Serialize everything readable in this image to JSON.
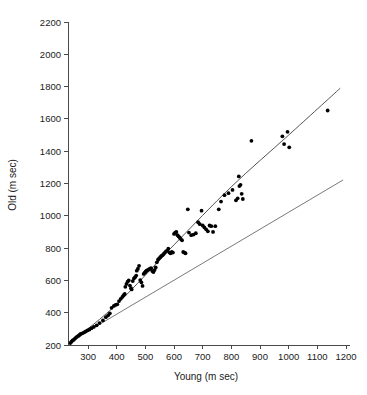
{
  "chart_data": {
    "type": "scatter",
    "title": "",
    "xlabel": "Young (m sec)",
    "ylabel": "Old (m sec)",
    "xlim": [
      230,
      1200
    ],
    "ylim": [
      200,
      2200
    ],
    "grid": false,
    "legend": "none",
    "xticks": [
      300,
      400,
      500,
      600,
      700,
      800,
      900,
      1000,
      1100,
      1200
    ],
    "yticks": [
      200,
      400,
      600,
      800,
      1000,
      1200,
      1400,
      1600,
      1800,
      2000,
      2200
    ],
    "xtick_labels": [
      "300",
      "400",
      "500",
      "600",
      "700",
      "800",
      "900",
      "1000",
      "1100",
      "1200"
    ],
    "ytick_labels": [
      "200",
      "400",
      "600",
      "800",
      "1000",
      "1200",
      "1400",
      "1600",
      "1800",
      "2000",
      "2200"
    ],
    "point_color": "#000000",
    "fit_line_color": "#555555",
    "identity_line_color": "#7a7a7a",
    "series": [
      {
        "name": "Old vs Young response times",
        "marker": "filled-circle",
        "points": [
          [
            238,
            212
          ],
          [
            242,
            220
          ],
          [
            246,
            228
          ],
          [
            250,
            232
          ],
          [
            254,
            240
          ],
          [
            258,
            246
          ],
          [
            262,
            252
          ],
          [
            266,
            256
          ],
          [
            270,
            262
          ],
          [
            274,
            268
          ],
          [
            280,
            272
          ],
          [
            286,
            278
          ],
          [
            292,
            284
          ],
          [
            298,
            290
          ],
          [
            305,
            296
          ],
          [
            312,
            304
          ],
          [
            320,
            312
          ],
          [
            330,
            322
          ],
          [
            340,
            336
          ],
          [
            352,
            352
          ],
          [
            362,
            372
          ],
          [
            370,
            384
          ],
          [
            376,
            396
          ],
          [
            382,
            430
          ],
          [
            390,
            442
          ],
          [
            396,
            448
          ],
          [
            402,
            452
          ],
          [
            408,
            472
          ],
          [
            414,
            486
          ],
          [
            420,
            498
          ],
          [
            424,
            508
          ],
          [
            428,
            516
          ],
          [
            430,
            560
          ],
          [
            434,
            578
          ],
          [
            438,
            592
          ],
          [
            442,
            600
          ],
          [
            446,
            568
          ],
          [
            450,
            552
          ],
          [
            452,
            544
          ],
          [
            456,
            596
          ],
          [
            460,
            612
          ],
          [
            464,
            620
          ],
          [
            468,
            630
          ],
          [
            470,
            660
          ],
          [
            474,
            672
          ],
          [
            478,
            690
          ],
          [
            482,
            602
          ],
          [
            486,
            588
          ],
          [
            490,
            566
          ],
          [
            494,
            640
          ],
          [
            498,
            648
          ],
          [
            500,
            652
          ],
          [
            502,
            656
          ],
          [
            504,
            660
          ],
          [
            508,
            664
          ],
          [
            512,
            668
          ],
          [
            516,
            672
          ],
          [
            520,
            676
          ],
          [
            524,
            658
          ],
          [
            528,
            652
          ],
          [
            532,
            664
          ],
          [
            536,
            680
          ],
          [
            540,
            712
          ],
          [
            544,
            728
          ],
          [
            548,
            736
          ],
          [
            552,
            744
          ],
          [
            556,
            752
          ],
          [
            560,
            756
          ],
          [
            564,
            764
          ],
          [
            568,
            772
          ],
          [
            572,
            780
          ],
          [
            576,
            784
          ],
          [
            580,
            796
          ],
          [
            584,
            772
          ],
          [
            588,
            768
          ],
          [
            592,
            776
          ],
          [
            596,
            772
          ],
          [
            600,
            888
          ],
          [
            604,
            896
          ],
          [
            608,
            900
          ],
          [
            612,
            880
          ],
          [
            616,
            872
          ],
          [
            620,
            864
          ],
          [
            624,
            856
          ],
          [
            628,
            848
          ],
          [
            632,
            776
          ],
          [
            636,
            772
          ],
          [
            640,
            768
          ],
          [
            648,
            1040
          ],
          [
            652,
            896
          ],
          [
            660,
            880
          ],
          [
            668,
            884
          ],
          [
            676,
            892
          ],
          [
            684,
            960
          ],
          [
            690,
            948
          ],
          [
            696,
            1032
          ],
          [
            700,
            940
          ],
          [
            706,
            928
          ],
          [
            712,
            916
          ],
          [
            718,
            904
          ],
          [
            724,
            940
          ],
          [
            730,
            936
          ],
          [
            736,
            900
          ],
          [
            744,
            936
          ],
          [
            756,
            1040
          ],
          [
            764,
            1088
          ],
          [
            776,
            1128
          ],
          [
            790,
            1140
          ],
          [
            804,
            1160
          ],
          [
            816,
            1096
          ],
          [
            822,
            1108
          ],
          [
            828,
            1184
          ],
          [
            832,
            1192
          ],
          [
            836,
            1136
          ],
          [
            840,
            1104
          ],
          [
            826,
            1244
          ],
          [
            870,
            1464
          ],
          [
            978,
            1492
          ],
          [
            984,
            1444
          ],
          [
            996,
            1520
          ],
          [
            1002,
            1424
          ],
          [
            1136,
            1652
          ]
        ]
      }
    ],
    "annotations": [
      {
        "name": "regression-fit-curve",
        "description": "Fitted regression line through the data, slightly curved, running from lower-left origin to upper-right",
        "points": [
          [
            232,
            206
          ],
          [
            400,
            452
          ],
          [
            600,
            820
          ],
          [
            800,
            1180
          ],
          [
            1000,
            1500
          ],
          [
            1180,
            1790
          ]
        ]
      },
      {
        "name": "identity-reference-line",
        "description": "Diagonal reference line where Old equals Young",
        "points": [
          [
            232,
            214
          ],
          [
            1190,
            1222
          ]
        ]
      }
    ]
  },
  "axes": {
    "x_axis_title": "Young (m sec)",
    "y_axis_title": "Old (m sec)"
  }
}
